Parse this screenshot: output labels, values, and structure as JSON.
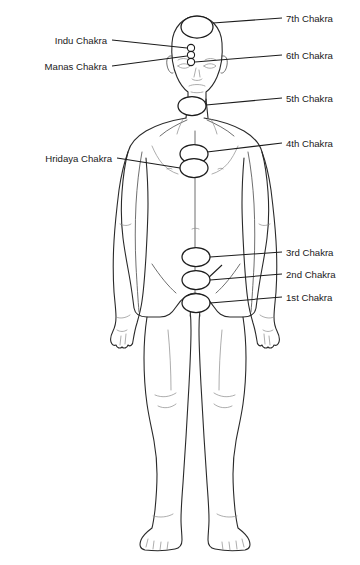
{
  "diagram": {
    "type": "anatomical-annotated-diagram",
    "background_color": "#ffffff",
    "line_color": "#2a2a2a",
    "label_color": "#1a1a1a",
    "figure": {
      "name": "human-body-front-view-outline",
      "description": "Front-facing full-body male outline, arms at sides, standing"
    },
    "labels_right": [
      {
        "id": "chakra-7",
        "text": "7th Chakra",
        "x": 286,
        "y": 20,
        "marker": {
          "cx": 197,
          "cy": 27,
          "rx": 16,
          "ry": 11
        },
        "marker_type": "oval"
      },
      {
        "id": "chakra-6",
        "text": "6th Chakra",
        "x": 286,
        "y": 58,
        "marker": {
          "cx": 191,
          "cy": 62,
          "r": 3.6
        },
        "marker_type": "dot"
      },
      {
        "id": "chakra-5",
        "text": "5th Chakra",
        "x": 286,
        "y": 101,
        "marker": {
          "cx": 192,
          "cy": 106,
          "rx": 14,
          "ry": 9.5
        },
        "marker_type": "oval"
      },
      {
        "id": "chakra-4",
        "text": "4th Chakra",
        "x": 286,
        "y": 146,
        "marker": {
          "cx": 194,
          "cy": 154,
          "rx": 14,
          "ry": 9.5
        },
        "marker_type": "oval"
      },
      {
        "id": "chakra-3",
        "text": "3rd Chakra",
        "x": 286,
        "y": 255,
        "marker": {
          "cx": 196,
          "cy": 257,
          "rx": 14,
          "ry": 9.5
        },
        "marker_type": "oval"
      },
      {
        "id": "chakra-2",
        "text": "2nd Chakra",
        "x": 286,
        "y": 277,
        "marker": {
          "cx": 196,
          "cy": 280,
          "rx": 14,
          "ry": 9.5
        },
        "marker_type": "oval"
      },
      {
        "id": "chakra-1",
        "text": "1st Chakra",
        "x": 286,
        "y": 300,
        "marker": {
          "cx": 196,
          "cy": 303,
          "rx": 14,
          "ry": 9.5
        },
        "marker_type": "oval"
      }
    ],
    "labels_left": [
      {
        "id": "indu-chakra",
        "text": "Indu Chakra",
        "x": 107,
        "y": 43,
        "marker": {
          "cx": 191,
          "cy": 48,
          "r": 3.6
        },
        "marker_type": "dot"
      },
      {
        "id": "manas-chakra",
        "text": "Manas Chakra",
        "x": 107,
        "y": 69,
        "marker": {
          "cx": 191,
          "cy": 55,
          "r": 3.6
        },
        "marker_type": "dot"
      },
      {
        "id": "hridaya-chakra",
        "text": "Hridaya Chakra",
        "x": 112,
        "y": 161,
        "marker": {
          "cx": 194,
          "cy": 168,
          "rx": 14,
          "ry": 9.5
        },
        "marker_type": "oval"
      }
    ],
    "chakra_markers": [
      {
        "id": "marker-crown",
        "shape": "ellipse",
        "cx": 197,
        "cy": 27,
        "rx": 16,
        "ry": 11
      },
      {
        "id": "marker-indu",
        "shape": "circle",
        "cx": 191,
        "cy": 48,
        "r": 3.6
      },
      {
        "id": "marker-manas",
        "shape": "circle",
        "cx": 191,
        "cy": 55,
        "r": 3.6
      },
      {
        "id": "marker-ajna",
        "shape": "circle",
        "cx": 191,
        "cy": 62,
        "r": 3.6
      },
      {
        "id": "marker-throat",
        "shape": "ellipse",
        "cx": 192,
        "cy": 106,
        "rx": 14,
        "ry": 9.5
      },
      {
        "id": "marker-heart",
        "shape": "ellipse",
        "cx": 194,
        "cy": 154,
        "rx": 14,
        "ry": 9.5
      },
      {
        "id": "marker-hridaya",
        "shape": "ellipse",
        "cx": 194,
        "cy": 168,
        "rx": 14,
        "ry": 9.5
      },
      {
        "id": "marker-navel",
        "shape": "ellipse",
        "cx": 196,
        "cy": 257,
        "rx": 14,
        "ry": 9.5
      },
      {
        "id": "marker-sacral",
        "shape": "ellipse",
        "cx": 196,
        "cy": 280,
        "rx": 14,
        "ry": 9.5
      },
      {
        "id": "marker-root",
        "shape": "ellipse",
        "cx": 196,
        "cy": 303,
        "rx": 14,
        "ry": 9.5
      }
    ]
  }
}
